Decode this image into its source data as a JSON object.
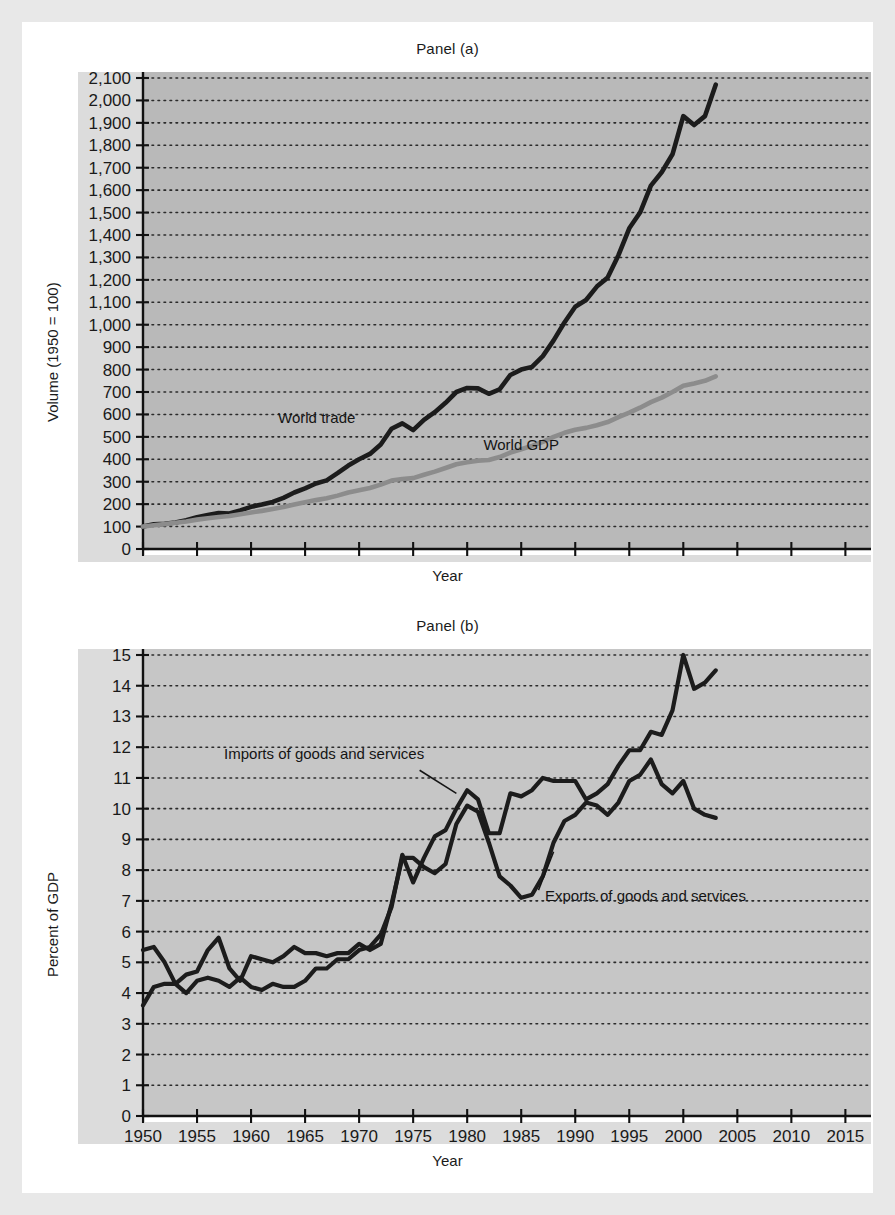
{
  "figure": {
    "background_color": "#e8e8e8",
    "page_color": "#ffffff",
    "plot_background_color": "#b9b9b9",
    "plot_background_color_b": "#c6c6c6",
    "grid_color": "#2b2b2b",
    "axis_color": "#111111",
    "label_band_color": "#dcdcdc"
  },
  "panel_a": {
    "title": "Panel (a)",
    "xlabel": "Year",
    "ylabel": "Volume (1950 = 100)",
    "series_label_trade": "World trade",
    "series_label_gdp": "World GDP",
    "color_trade": "#1c1c1c",
    "color_gdp": "#8c8c8c"
  },
  "panel_b": {
    "title": "Panel (b)",
    "xlabel": "Year",
    "ylabel": "Percent of GDP",
    "series_label_imports": "Imports of goods and services",
    "series_label_exports": "Exports of goods and services",
    "color_imports": "#1c1c1c",
    "color_exports": "#1c1c1c"
  },
  "chart_data": [
    {
      "id": "panel_a",
      "type": "line",
      "title": "Panel (a)",
      "xlabel": "Year",
      "ylabel": "Volume (1950 = 100)",
      "xlim": [
        1950,
        2017
      ],
      "ylim": [
        0,
        2100
      ],
      "xticks": [
        1950,
        1955,
        1960,
        1965,
        1970,
        1975,
        1980,
        1985,
        1990,
        1995,
        2000,
        2005,
        2010,
        2015
      ],
      "yticks": [
        0,
        100,
        200,
        300,
        400,
        500,
        600,
        700,
        800,
        900,
        1000,
        1100,
        1200,
        1300,
        1400,
        1500,
        1600,
        1700,
        1800,
        1900,
        2000,
        2100
      ],
      "ytick_labels": [
        "0",
        "100",
        "200",
        "300",
        "400",
        "500",
        "600",
        "700",
        "800",
        "900",
        "1,000",
        "1,100",
        "1,200",
        "1,300",
        "1,400",
        "1,500",
        "1,600",
        "1,700",
        "1,800",
        "1,900",
        "2,000",
        "2,100"
      ],
      "grid": true,
      "legend": "inline-annotations",
      "series": [
        {
          "name": "World trade",
          "color": "#1c1c1c",
          "x": [
            1950,
            1951,
            1952,
            1953,
            1954,
            1955,
            1956,
            1957,
            1958,
            1959,
            1960,
            1961,
            1962,
            1963,
            1964,
            1965,
            1966,
            1967,
            1968,
            1969,
            1970,
            1971,
            1972,
            1973,
            1974,
            1975,
            1976,
            1977,
            1978,
            1979,
            1980,
            1981,
            1982,
            1983,
            1984,
            1985,
            1986,
            1987,
            1988,
            1989,
            1990,
            1991,
            1992,
            1993,
            1994,
            1995,
            1996,
            1997,
            1998,
            1999,
            2000,
            2001,
            2002,
            2003
          ],
          "values": [
            100,
            110,
            112,
            118,
            128,
            142,
            152,
            160,
            158,
            172,
            188,
            198,
            210,
            228,
            252,
            270,
            292,
            306,
            338,
            372,
            400,
            424,
            466,
            536,
            560,
            530,
            576,
            610,
            652,
            700,
            718,
            716,
            692,
            712,
            776,
            800,
            812,
            860,
            930,
            1010,
            1080,
            1110,
            1170,
            1210,
            1310,
            1430,
            1500,
            1620,
            1680,
            1760,
            1930,
            1890,
            1930,
            2070
          ]
        },
        {
          "name": "World GDP",
          "color": "#8c8c8c",
          "x": [
            1950,
            1951,
            1952,
            1953,
            1954,
            1955,
            1956,
            1957,
            1958,
            1959,
            1960,
            1961,
            1962,
            1963,
            1964,
            1965,
            1966,
            1967,
            1968,
            1969,
            1970,
            1971,
            1972,
            1973,
            1974,
            1975,
            1976,
            1977,
            1978,
            1979,
            1980,
            1981,
            1982,
            1983,
            1984,
            1985,
            1986,
            1987,
            1988,
            1989,
            1990,
            1991,
            1992,
            1993,
            1994,
            1995,
            1996,
            1997,
            1998,
            1999,
            2000,
            2001,
            2002,
            2003
          ],
          "values": [
            100,
            106,
            111,
            117,
            123,
            131,
            137,
            143,
            147,
            155,
            163,
            170,
            178,
            187,
            198,
            208,
            218,
            226,
            238,
            252,
            262,
            272,
            287,
            305,
            312,
            316,
            331,
            345,
            361,
            378,
            387,
            394,
            397,
            410,
            430,
            445,
            460,
            478,
            500,
            518,
            532,
            540,
            552,
            566,
            588,
            608,
            630,
            655,
            675,
            700,
            728,
            738,
            750,
            770
          ]
        }
      ]
    },
    {
      "id": "panel_b",
      "type": "line",
      "title": "Panel (b)",
      "xlabel": "Year",
      "ylabel": "Percent of GDP",
      "xlim": [
        1950,
        2017
      ],
      "ylim": [
        0,
        15
      ],
      "xticks": [
        1950,
        1955,
        1960,
        1965,
        1970,
        1975,
        1980,
        1985,
        1990,
        1995,
        2000,
        2005,
        2010,
        2015
      ],
      "yticks": [
        0,
        1,
        2,
        3,
        4,
        5,
        6,
        7,
        8,
        9,
        10,
        11,
        12,
        13,
        14,
        15
      ],
      "ytick_labels": [
        "0",
        "1",
        "2",
        "3",
        "4",
        "5",
        "6",
        "7",
        "8",
        "9",
        "10",
        "11",
        "12",
        "13",
        "14",
        "15"
      ],
      "grid": true,
      "legend": "inline-annotations",
      "annotations": [
        {
          "text": "Imports of goods and services",
          "points_to_year": 1979,
          "points_to_value": 10.5
        },
        {
          "text": "Exports of goods and services",
          "points_to_year": 1988,
          "points_to_value": 8.6
        }
      ],
      "series": [
        {
          "name": "Exports of goods and services",
          "color": "#1c1c1c",
          "x": [
            1950,
            1951,
            1952,
            1953,
            1954,
            1955,
            1956,
            1957,
            1958,
            1959,
            1960,
            1961,
            1962,
            1963,
            1964,
            1965,
            1966,
            1967,
            1968,
            1969,
            1970,
            1971,
            1972,
            1973,
            1974,
            1975,
            1976,
            1977,
            1978,
            1979,
            1980,
            1981,
            1982,
            1983,
            1984,
            1985,
            1986,
            1987,
            1988,
            1989,
            1990,
            1991,
            1992,
            1993,
            1994,
            1995,
            1996,
            1997,
            1998,
            1999,
            2000,
            2001,
            2002,
            2003
          ],
          "values": [
            5.4,
            5.5,
            5.0,
            4.3,
            4.6,
            4.7,
            5.4,
            5.8,
            4.8,
            4.4,
            5.2,
            5.1,
            5.0,
            5.2,
            5.5,
            5.3,
            5.3,
            5.2,
            5.3,
            5.3,
            5.6,
            5.4,
            5.6,
            6.9,
            8.4,
            8.4,
            8.1,
            7.9,
            8.2,
            9.5,
            10.1,
            9.9,
            8.9,
            7.8,
            7.5,
            7.1,
            7.2,
            7.8,
            8.9,
            9.6,
            9.8,
            10.2,
            10.1,
            9.8,
            10.2,
            10.9,
            11.1,
            11.6,
            10.8,
            10.5,
            10.9,
            10.0,
            9.8,
            9.7
          ]
        },
        {
          "name": "Imports of goods and services",
          "color": "#1c1c1c",
          "x": [
            1950,
            1951,
            1952,
            1953,
            1954,
            1955,
            1956,
            1957,
            1958,
            1959,
            1960,
            1961,
            1962,
            1963,
            1964,
            1965,
            1966,
            1967,
            1968,
            1969,
            1970,
            1971,
            1972,
            1973,
            1974,
            1975,
            1976,
            1977,
            1978,
            1979,
            1980,
            1981,
            1982,
            1983,
            1984,
            1985,
            1986,
            1987,
            1988,
            1989,
            1990,
            1991,
            1992,
            1993,
            1994,
            1995,
            1996,
            1997,
            1998,
            1999,
            2000,
            2001,
            2002,
            2003
          ],
          "values": [
            3.6,
            4.2,
            4.3,
            4.3,
            4.0,
            4.4,
            4.5,
            4.4,
            4.2,
            4.5,
            4.2,
            4.1,
            4.3,
            4.2,
            4.2,
            4.4,
            4.8,
            4.8,
            5.1,
            5.1,
            5.4,
            5.5,
            5.9,
            6.8,
            8.5,
            7.6,
            8.4,
            9.1,
            9.3,
            10.0,
            10.6,
            10.3,
            9.2,
            9.2,
            10.5,
            10.4,
            10.6,
            11.0,
            10.9,
            10.9,
            10.9,
            10.3,
            10.5,
            10.8,
            11.4,
            11.9,
            11.9,
            12.5,
            12.4,
            13.2,
            15.0,
            13.9,
            14.1,
            14.5
          ]
        }
      ]
    }
  ]
}
